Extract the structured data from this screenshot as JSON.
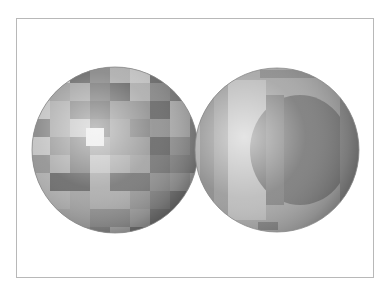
{
  "scene": {
    "description": "Two shaded spheres with blocky grayscale texture inside a thin gray frame",
    "frame_color": "#b8b8b8",
    "spheres": [
      {
        "name": "checker-sphere",
        "cx": 115,
        "cy": 150,
        "r": 83,
        "pattern": "checker"
      },
      {
        "name": "striped-sphere",
        "cx": 277,
        "cy": 150,
        "r": 82,
        "pattern": "vertical-bands"
      }
    ]
  }
}
